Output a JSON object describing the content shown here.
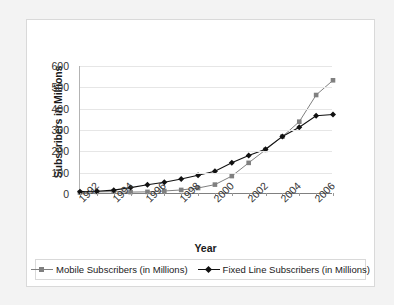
{
  "chart_data": {
    "type": "line",
    "title": "",
    "xlabel": "Year",
    "ylabel": "Subscribers in Millions",
    "grid": true,
    "legend_position": "bottom",
    "xlim": [
      1992,
      2007
    ],
    "ylim": [
      0,
      600
    ],
    "ytick_values": [
      0,
      100,
      200,
      300,
      400,
      500,
      600
    ],
    "ytick_labels": [
      "0",
      "100",
      "200",
      "300",
      "400",
      "500",
      "600"
    ],
    "xtick_labels": [
      "1992",
      "1994",
      "1996",
      "1998",
      "2000",
      "2002",
      "2004",
      "2006"
    ],
    "xtick_values": [
      1992,
      1994,
      1996,
      1998,
      2000,
      2002,
      2004,
      2006
    ],
    "x": [
      1992,
      1993,
      1994,
      1995,
      1996,
      1997,
      1998,
      1999,
      2000,
      2001,
      2002,
      2003,
      2004,
      2005,
      2006,
      2007
    ],
    "series": [
      {
        "name": "Mobile Subscribers (in Millions)",
        "color": "#808080",
        "marker": "square",
        "values": [
          7,
          10,
          11,
          9,
          10,
          14,
          19,
          28,
          44,
          84,
          146,
          207,
          269,
          339,
          464,
          533
        ]
      },
      {
        "name": "Fixed Line Subscribers (in Millions)",
        "color": "#111111",
        "marker": "diamond",
        "values": [
          11,
          13,
          18,
          30,
          43,
          55,
          70,
          88,
          107,
          146,
          181,
          210,
          270,
          313,
          367,
          373
        ]
      }
    ]
  },
  "axis": {
    "y_title": "Subscribers in Millions",
    "x_title": "Year"
  },
  "legend": {
    "entries": [
      {
        "label": "Mobile Subscribers (in Millions)"
      },
      {
        "label": "Fixed Line Subscribers (in Millions)"
      }
    ]
  }
}
